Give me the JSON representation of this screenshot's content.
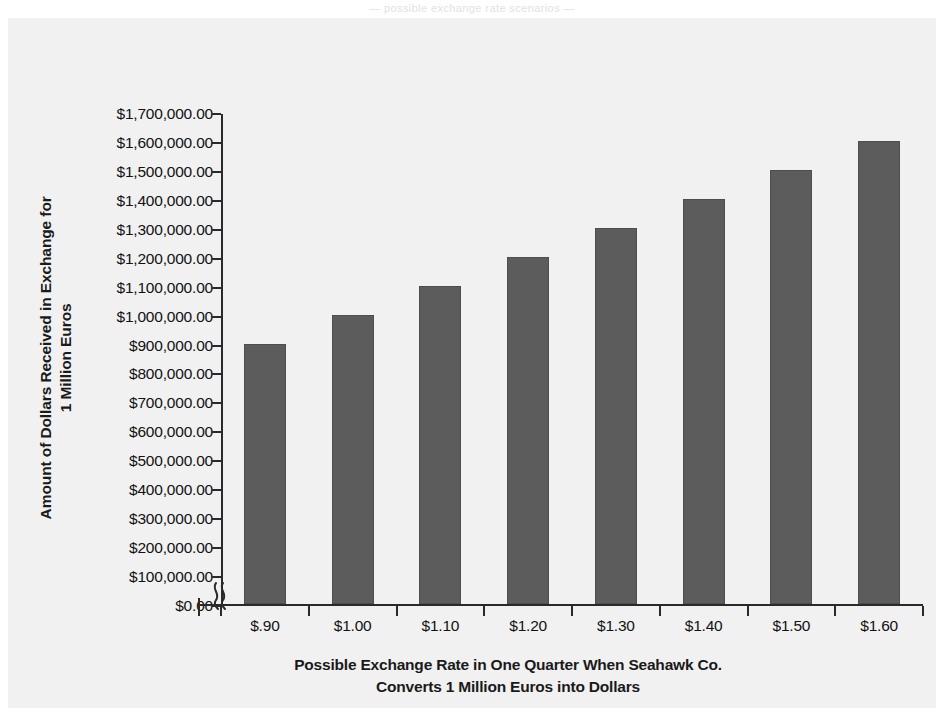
{
  "page_bleed_text": "— possible exchange rate scenarios —",
  "chart_data": {
    "type": "bar",
    "title": "",
    "subtitle": "",
    "categories": [
      "$.90",
      "$1.00",
      "$1.10",
      "$1.20",
      "$1.30",
      "$1.40",
      "$1.50",
      "$1.60"
    ],
    "x_numeric": [
      0.9,
      1.0,
      1.1,
      1.2,
      1.3,
      1.4,
      1.5,
      1.6
    ],
    "values": [
      900000,
      1000000,
      1100000,
      1200000,
      1300000,
      1400000,
      1500000,
      1600000
    ],
    "value_labels": [
      "$900,000.00",
      "$1,000,000.00",
      "$1,100,000.00",
      "$1,200,000.00",
      "$1,300,000.00",
      "$1,400,000.00",
      "$1,500,000.00",
      "$1,600,000.00"
    ],
    "series": [
      {
        "name": "Dollars Received",
        "values": [
          900000,
          1000000,
          1100000,
          1200000,
          1300000,
          1400000,
          1500000,
          1600000
        ]
      }
    ],
    "xlabel": "Possible Exchange Rate in One Quarter When Seahawk Co. Converts 1 Million Euros into Dollars",
    "xlabel_lines": [
      "Possible Exchange Rate in One Quarter When Seahawk Co.",
      "Converts 1 Million Euros into Dollars"
    ],
    "ylabel": "Amount of Dollars Received in Exchange for 1 Million Euros",
    "ylabel_lines": [
      "Amount of Dollars Received in Exchange for",
      "1 Million Euros"
    ],
    "ylim": [
      0,
      1700000
    ],
    "y_tick_step": 100000,
    "y_tick_labels": [
      "$1,700,000.00",
      "$1,600,000.00",
      "$1,500,000.00",
      "$1,400,000.00",
      "$1,300,000.00",
      "$1,200,000.00",
      "$1,100,000.00",
      "$1,000,000.00",
      "$900,000.00",
      "$800,000.00",
      "$700,000.00",
      "$600,000.00",
      "$500,000.00",
      "$400,000.00",
      "$300,000.00",
      "$200,000.00",
      "$100,000.00",
      "$0.00"
    ],
    "y_tick_values": [
      1700000,
      1600000,
      1500000,
      1400000,
      1300000,
      1200000,
      1100000,
      1000000,
      900000,
      800000,
      700000,
      600000,
      500000,
      400000,
      300000,
      200000,
      100000,
      0
    ],
    "grid": false,
    "legend": false,
    "legend_position": "none",
    "x_axis_break": true,
    "x_axis_break_note": "squiggle break between origin and first category",
    "colors": {
      "bar_fill": "#5c5c5c",
      "bar_edge": "#4e4e4e",
      "axis": "#2a2a2a",
      "text": "#121212",
      "plot_background": "#f1f1f1",
      "figure_background": "#ffffff"
    }
  }
}
